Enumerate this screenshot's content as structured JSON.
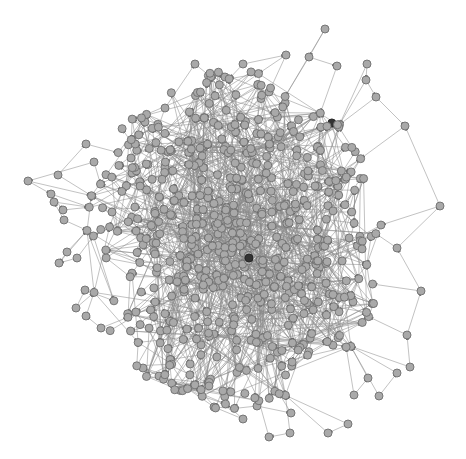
{
  "diagram": {
    "type": "directed-network-graph",
    "width": 466,
    "height": 459,
    "background": "#ffffff",
    "node_fill": "#a9a9a9",
    "node_stroke": "#6e6e6e",
    "edge_color": "#8a8a8a",
    "node_radius": 4,
    "highlight_node_fill": "#333333",
    "core": {
      "cx": 235,
      "cy": 240,
      "rx": 150,
      "ry": 170,
      "node_count": 560,
      "edge_count": 1300,
      "seed": 7
    },
    "peripheral_nodes": [
      [
        325,
        29
      ],
      [
        309,
        57
      ],
      [
        337,
        66
      ],
      [
        367,
        64
      ],
      [
        366,
        80
      ],
      [
        376,
        97
      ],
      [
        405,
        126
      ],
      [
        440,
        206
      ],
      [
        397,
        248
      ],
      [
        421,
        291
      ],
      [
        407,
        335
      ],
      [
        410,
        367
      ],
      [
        379,
        396
      ],
      [
        397,
        373
      ],
      [
        354,
        395
      ],
      [
        368,
        378
      ],
      [
        348,
        424
      ],
      [
        328,
        433
      ],
      [
        290,
        433
      ],
      [
        269,
        437
      ],
      [
        257,
        406
      ],
      [
        291,
        413
      ],
      [
        243,
        419
      ],
      [
        214,
        407
      ],
      [
        159,
        376
      ],
      [
        143,
        368
      ],
      [
        101,
        328
      ],
      [
        86,
        316
      ],
      [
        76,
        308
      ],
      [
        85,
        290
      ],
      [
        77,
        258
      ],
      [
        59,
        263
      ],
      [
        67,
        252
      ],
      [
        58,
        175
      ],
      [
        86,
        144
      ],
      [
        94,
        162
      ],
      [
        28,
        181
      ],
      [
        51,
        194
      ],
      [
        63,
        210
      ],
      [
        64,
        220
      ],
      [
        54,
        202
      ],
      [
        112,
        212
      ],
      [
        132,
        173
      ],
      [
        131,
        158
      ],
      [
        145,
        122
      ],
      [
        165,
        108
      ],
      [
        195,
        64
      ],
      [
        212,
        76
      ],
      [
        225,
        77
      ],
      [
        243,
        64
      ],
      [
        286,
        55
      ],
      [
        269,
        92
      ]
    ],
    "peripheral_edges": [
      [
        0,
        1
      ],
      [
        1,
        2
      ],
      [
        3,
        4
      ],
      [
        4,
        5
      ],
      [
        5,
        6
      ],
      [
        7,
        6
      ],
      [
        8,
        7
      ],
      [
        9,
        8
      ],
      [
        10,
        9
      ],
      [
        11,
        10
      ],
      [
        12,
        13
      ],
      [
        14,
        15
      ],
      [
        16,
        17
      ],
      [
        18,
        19
      ],
      [
        20,
        21
      ],
      [
        22,
        23
      ],
      [
        24,
        25
      ],
      [
        26,
        27
      ],
      [
        28,
        29
      ],
      [
        30,
        31
      ],
      [
        32,
        31
      ],
      [
        33,
        34
      ],
      [
        35,
        36
      ],
      [
        36,
        37
      ],
      [
        37,
        38
      ],
      [
        39,
        40
      ],
      [
        41,
        42
      ],
      [
        43,
        44
      ],
      [
        45,
        46
      ],
      [
        47,
        48
      ],
      [
        49,
        50
      ],
      [
        50,
        51
      ]
    ]
  }
}
